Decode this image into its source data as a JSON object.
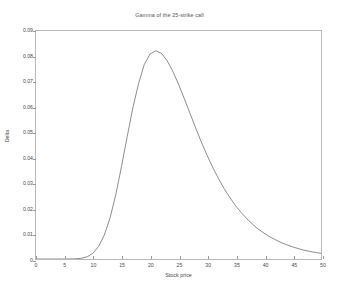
{
  "chart_data": {
    "type": "line",
    "title": "Gamma of the 25-strike call",
    "xlabel": "Stock price",
    "ylabel": "Delta",
    "xlim": [
      0,
      50
    ],
    "ylim": [
      0,
      0.09
    ],
    "grid": false,
    "legend": null,
    "line_color": "#5a5a5a",
    "xticks": [
      "0",
      "5",
      "10",
      "15",
      "20",
      "25",
      "30",
      "35",
      "40",
      "45",
      "50"
    ],
    "xtick_values": [
      0,
      5,
      10,
      15,
      20,
      25,
      30,
      35,
      40,
      45,
      50
    ],
    "yticks": [
      "0",
      "0.01",
      "0.02",
      "0.03",
      "0.04",
      "0.05",
      "0.06",
      "0.07",
      "0.08",
      "0.09"
    ],
    "ytick_values": [
      0,
      0.01,
      0.02,
      0.03,
      0.04,
      0.05,
      0.06,
      0.07,
      0.08,
      0.09
    ],
    "peak": {
      "x": 21,
      "y": 0.0822
    },
    "x": [
      0,
      1,
      2,
      3,
      4,
      5,
      6,
      7,
      8,
      9,
      10,
      11,
      12,
      13,
      14,
      15,
      16,
      17,
      18,
      19,
      20,
      21,
      22,
      23,
      24,
      25,
      26,
      27,
      28,
      29,
      30,
      31,
      32,
      33,
      34,
      35,
      36,
      37,
      38,
      39,
      40,
      41,
      42,
      43,
      44,
      45,
      46,
      47,
      48,
      49,
      50
    ],
    "y": [
      0,
      0,
      0,
      0,
      0,
      0,
      2e-05,
      9e-05,
      0.0003,
      0.0009,
      0.0023,
      0.005,
      0.0095,
      0.0163,
      0.0254,
      0.0365,
      0.0483,
      0.0598,
      0.0693,
      0.0768,
      0.0809,
      0.0822,
      0.0812,
      0.0783,
      0.0741,
      0.069,
      0.0634,
      0.0576,
      0.0518,
      0.0462,
      0.041,
      0.0362,
      0.0318,
      0.0278,
      0.0243,
      0.0211,
      0.0183,
      0.0159,
      0.0137,
      0.0118,
      0.0102,
      0.0088,
      0.0076,
      0.0065,
      0.0056,
      0.0048,
      0.0041,
      0.0035,
      0.003,
      0.0026,
      0.0022
    ]
  }
}
